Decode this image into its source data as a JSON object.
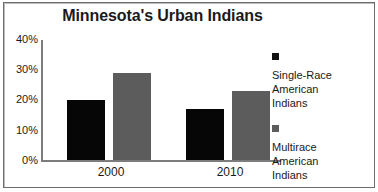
{
  "chart_data": {
    "type": "bar",
    "title": "Minnesota's Urban Indians",
    "xlabel": "",
    "ylabel": "",
    "categories": [
      "2000",
      "2010"
    ],
    "series": [
      {
        "name": "Single-Race American Indians",
        "values": [
          20,
          17
        ],
        "color": "#060606"
      },
      {
        "name": "Multirace American Indians",
        "values": [
          29,
          23
        ],
        "color": "#5c5c5c"
      }
    ],
    "ylim": [
      0,
      40
    ],
    "ytick_values": [
      0,
      10,
      20,
      30,
      40
    ],
    "ytick_labels": [
      "0%",
      "10%",
      "20%",
      "30%",
      "40%"
    ],
    "grid": false,
    "legend_position": "right",
    "value_format": "percent"
  },
  "legend": {
    "entries": [
      {
        "swatch": "black-square-swatch",
        "lines": [
          "Single-Race",
          "American",
          "Indians"
        ]
      },
      {
        "swatch": "gray-square-swatch",
        "lines": [
          "Multirace",
          "American",
          "Indians"
        ]
      }
    ]
  },
  "colors": {
    "single_race": "#060606",
    "multirace": "#5c5c5c",
    "axis": "#7c7c7c",
    "border": "#6d6d6d",
    "text": "#1a1a1a",
    "background": "#ffffff"
  }
}
